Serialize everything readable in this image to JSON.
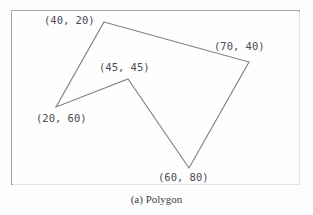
{
  "figure": {
    "caption": "(a) Polygon",
    "frame_color": "#a8a8ac",
    "background_color": "#fdfdfd",
    "outline_color": "#7f7f88"
  },
  "chart_data": {
    "type": "scatter",
    "title": "(a) Polygon",
    "xlabel": "",
    "ylabel": "",
    "grid": false,
    "legend": null,
    "shape": "closed polygon (concave)",
    "vertex_order": [
      "(40, 20)",
      "(70, 40)",
      "(60, 80)",
      "(45, 45)",
      "(20, 60)"
    ],
    "points": [
      {
        "label": "(40, 20)",
        "x": 40,
        "y": 20,
        "px": 104,
        "py": 22
      },
      {
        "label": "(70, 40)",
        "x": 70,
        "y": 40,
        "px": 249,
        "py": 62
      },
      {
        "label": "(60, 80)",
        "x": 60,
        "y": 80,
        "px": 189,
        "py": 168
      },
      {
        "label": "(45, 45)",
        "x": 45,
        "y": 45,
        "px": 128,
        "py": 79
      },
      {
        "label": "(20, 60)",
        "x": 20,
        "y": 60,
        "px": 56,
        "py": 107
      }
    ],
    "edges": [
      {
        "from": "(40, 20)",
        "to": "(70, 40)"
      },
      {
        "from": "(70, 40)",
        "to": "(60, 80)"
      },
      {
        "from": "(60, 80)",
        "to": "(45, 45)"
      },
      {
        "from": "(45, 45)",
        "to": "(20, 60)"
      },
      {
        "from": "(20, 60)",
        "to": "(40, 20)"
      }
    ]
  },
  "labels": {
    "p1": "(40, 20)",
    "p2": "(70, 40)",
    "p3": "(45, 45)",
    "p4": "(20, 60)",
    "p5": "(60, 80)"
  }
}
